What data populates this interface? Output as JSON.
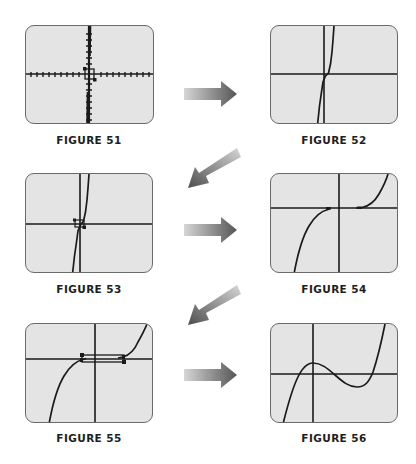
{
  "figures": [
    {
      "id": "51",
      "label": "FIGURE 51",
      "description": "Standard viewing window with zoom box drawn around origin"
    },
    {
      "id": "52",
      "label": "FIGURE 52",
      "description": "Zoomed-in view: steep nearly linear curve through origin"
    },
    {
      "id": "53",
      "label": "FIGURE 53",
      "description": "Same view with a small zoom box near origin"
    },
    {
      "id": "54",
      "label": "FIGURE 54",
      "description": "Further zoom: cubic-shaped curve with flattening near x-axis on both sides"
    },
    {
      "id": "55",
      "label": "FIGURE 55",
      "description": "Same view with a wide, thin zoom box along the x-axis"
    },
    {
      "id": "56",
      "label": "FIGURE 56",
      "description": "Final zoom: cubic with local max and local min, three x-intercepts"
    }
  ],
  "arrows": [
    {
      "from": "51",
      "to": "52",
      "direction": "right"
    },
    {
      "from": "52",
      "to": "53",
      "direction": "down-left"
    },
    {
      "from": "53",
      "to": "54",
      "direction": "right"
    },
    {
      "from": "54",
      "to": "55",
      "direction": "down-left"
    },
    {
      "from": "55",
      "to": "56",
      "direction": "right"
    }
  ],
  "colors": {
    "screen_bg": "#e4e4e4",
    "screen_border": "#6a6a6a",
    "ink": "#1a1a1a",
    "arrow_light": "#d0d0d0",
    "arrow_dark": "#5a5a5a"
  }
}
